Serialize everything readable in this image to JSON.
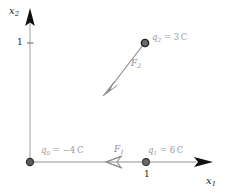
{
  "figure": {
    "type": "physics-vector-diagram"
  },
  "axes": {
    "x_axis": {
      "label_symbol": "x",
      "label_subscript": "1",
      "tick_label": "1",
      "arrow_direction": "right"
    },
    "y_axis": {
      "label_symbol": "x",
      "label_subscript": "2",
      "tick_label": "1",
      "arrow_direction": "up"
    },
    "axis_color": "#b5b5b5",
    "arrowhead_color": "#111111"
  },
  "charges": [
    {
      "name": "q0",
      "symbol": "q",
      "subscript": "0",
      "equals": "=",
      "value": "−4",
      "unit": "C",
      "position": [
        0,
        0
      ],
      "dot_color": "#555555"
    },
    {
      "name": "q1",
      "symbol": "q",
      "subscript": "1",
      "equals": "=",
      "value": "6",
      "unit": "C",
      "position": [
        1,
        0
      ],
      "dot_color": "#555555"
    },
    {
      "name": "q2",
      "symbol": "q",
      "subscript": "2",
      "equals": "=",
      "value": "3",
      "unit": "C",
      "position": [
        1,
        1
      ],
      "dot_color": "#2b2b2b"
    }
  ],
  "forces": [
    {
      "name": "F1",
      "symbol": "F",
      "subscript": "1",
      "direction": "left",
      "color": "#8f8f8f"
    },
    {
      "name": "F2",
      "symbol": "F",
      "subscript": "2",
      "direction": "down-left",
      "color": "#8f8f8f"
    }
  ]
}
